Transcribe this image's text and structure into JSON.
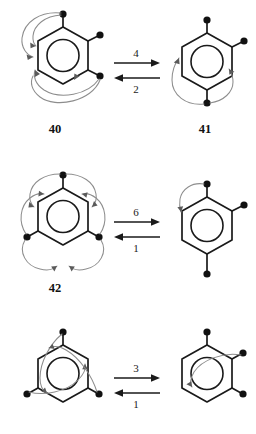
{
  "figure": {
    "kind": "chemical-scheme",
    "background_color": "#ffffff",
    "bond_color": "#1a1a1a",
    "permutation_arrow_color": "#8d8d8d"
  },
  "rows": [
    {
      "id": "row-1",
      "left": {
        "label": "40",
        "substituent_positions": [
          "C1",
          "C2",
          "C3"
        ],
        "permutation_arrow_count": 4
      },
      "right": {
        "label": "41",
        "substituent_positions": [
          "C1",
          "C2",
          "C4"
        ],
        "permutation_arrow_count": 2
      },
      "forward_label": "4",
      "reverse_label": "2"
    },
    {
      "id": "row-2",
      "left": {
        "label": "42",
        "substituent_positions": [
          "C1",
          "C3",
          "C5"
        ],
        "permutation_arrow_count": 6
      },
      "right": {
        "label": "",
        "substituent_positions": [
          "C1",
          "C2",
          "C4"
        ],
        "permutation_arrow_count": 1
      },
      "forward_label": "6",
      "reverse_label": "1"
    },
    {
      "id": "row-3",
      "left": {
        "label": "",
        "substituent_positions": [
          "C1",
          "C3",
          "C5"
        ],
        "permutation_arrow_count": 3
      },
      "right": {
        "label": "",
        "substituent_positions": [
          "C1",
          "C2",
          "C3"
        ],
        "permutation_arrow_count": 1
      },
      "forward_label": "3",
      "reverse_label": "1"
    }
  ],
  "structure_labels": {
    "forty": "40",
    "forty_one": "41",
    "forty_two": "42"
  },
  "arrow_labels": {
    "row1_forward": "4",
    "row1_reverse": "2",
    "row2_forward": "6",
    "row2_reverse": "1",
    "row3_forward": "3",
    "row3_reverse": "1"
  }
}
